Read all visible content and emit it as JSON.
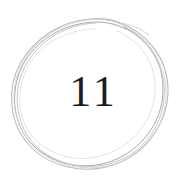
{
  "badge": {
    "number": "11",
    "number_value": 11,
    "shape": "hand-drawn-circle",
    "stroke_passes": 5
  },
  "colors": {
    "background": "#ffffff",
    "number": "#1b1b1b",
    "circle_stroke_dark": "#9a9a9a",
    "circle_stroke_mid": "#b4b4b4",
    "circle_stroke_light": "#cfcfcf",
    "circle_stroke_faint": "#dcdcdc"
  },
  "geometry": {
    "center_x": 92,
    "center_y": 92,
    "radius_outer": 76,
    "radius_inner": 66
  }
}
